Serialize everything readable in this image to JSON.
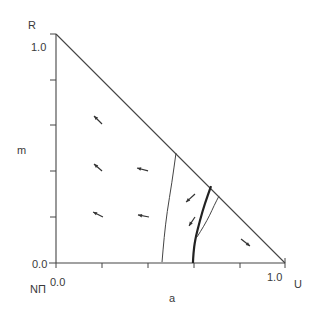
{
  "figure": {
    "vertex_top_label": "R",
    "vertex_origin_label": "NΠ",
    "vertex_right_label": "U",
    "y_axis_label": "m",
    "x_axis_label": "a",
    "y_tick_top": "1.0",
    "y_tick_bottom": "0.0",
    "x_tick_left": "0.0",
    "x_tick_right": "1.0",
    "line_color": "#444444"
  },
  "chart_data": {
    "type": "line",
    "title": "",
    "xlabel": "a",
    "ylabel": "m",
    "xlim": [
      0.0,
      1.0
    ],
    "ylim": [
      0.0,
      1.0
    ],
    "x_tick_labels": [
      "0.0",
      "1.0"
    ],
    "y_tick_labels": [
      "0.0",
      "1.0"
    ],
    "minor_ticks": [
      0.2,
      0.4,
      0.6,
      0.8
    ],
    "grid": false,
    "legend": null,
    "region": "triangle with vertices NΠ (0,0), U (1,0), R (0,1); boundary a + m = 1",
    "vertex_labels": {
      "origin": "NΠ",
      "x_end": "U",
      "y_end": "R"
    },
    "series": [
      {
        "name": "boundary-1",
        "style": "thin",
        "points": [
          [
            0.524,
            0.48
          ],
          [
            0.506,
            0.35
          ],
          [
            0.485,
            0.223
          ],
          [
            0.472,
            0.11
          ],
          [
            0.463,
            0.004
          ]
        ]
      },
      {
        "name": "boundary-2",
        "style": "thick",
        "points": [
          [
            0.677,
            0.336
          ],
          [
            0.65,
            0.26
          ],
          [
            0.629,
            0.188
          ],
          [
            0.607,
            0.1
          ],
          [
            0.6,
            0.04
          ],
          [
            0.598,
            0.0
          ]
        ]
      },
      {
        "name": "boundary-3",
        "style": "thin",
        "points": [
          [
            0.712,
            0.293
          ],
          [
            0.69,
            0.25
          ],
          [
            0.672,
            0.21
          ],
          [
            0.645,
            0.16
          ],
          [
            0.616,
            0.114
          ]
        ]
      }
    ],
    "vector_field": [
      {
        "from": [
          0.201,
          0.607
        ],
        "to": [
          0.166,
          0.642
        ]
      },
      {
        "from": [
          0.201,
          0.402
        ],
        "to": [
          0.166,
          0.432
        ]
      },
      {
        "from": [
          0.402,
          0.402
        ],
        "to": [
          0.354,
          0.415
        ]
      },
      {
        "from": [
          0.205,
          0.201
        ],
        "to": [
          0.162,
          0.223
        ]
      },
      {
        "from": [
          0.406,
          0.201
        ],
        "to": [
          0.358,
          0.21
        ]
      },
      {
        "from": [
          0.607,
          0.301
        ],
        "to": [
          0.568,
          0.266
        ]
      },
      {
        "from": [
          0.607,
          0.201
        ],
        "to": [
          0.581,
          0.162
        ]
      },
      {
        "from": [
          0.808,
          0.105
        ],
        "to": [
          0.847,
          0.074
        ]
      }
    ]
  }
}
